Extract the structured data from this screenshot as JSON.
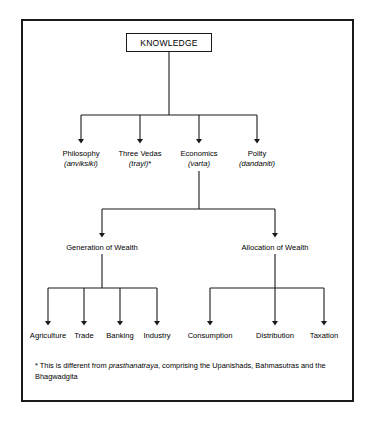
{
  "diagram": {
    "type": "hierarchy-tree",
    "root": {
      "label": "KNOWLEDGE"
    },
    "level2": [
      {
        "label": "Philosophy",
        "term": "(anviksiki)",
        "marker": ""
      },
      {
        "label": "Three Vedas",
        "term": "(trayi)",
        "marker": "*"
      },
      {
        "label": "Economics",
        "term": "(varta)",
        "marker": ""
      },
      {
        "label": "Polity",
        "term": "(dandaniti)",
        "marker": ""
      }
    ],
    "level3": [
      {
        "label": "Generation of Wealth"
      },
      {
        "label": "Allocation of Wealth"
      }
    ],
    "leaves_left": [
      {
        "label": "Agriculture"
      },
      {
        "label": "Trade"
      },
      {
        "label": "Banking"
      },
      {
        "label": "Industry"
      }
    ],
    "leaves_right": [
      {
        "label": "Consumption"
      },
      {
        "label": "Distribution"
      },
      {
        "label": "Taxation"
      }
    ],
    "footnote": {
      "marker": "*",
      "text_before": " This is different from ",
      "emphasis": "prasthanatraya",
      "text_after": ", comprising the Upanishads, Bahmasutras and the Bhagwadgita"
    },
    "colors": {
      "stroke": "#1a1a1a",
      "background": "#ffffff",
      "text": "#000000"
    }
  }
}
